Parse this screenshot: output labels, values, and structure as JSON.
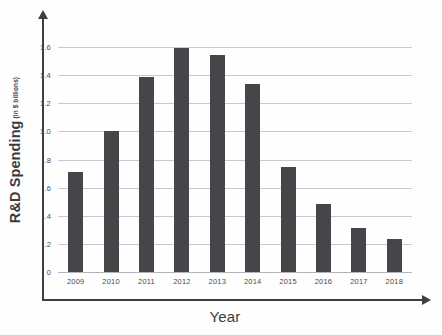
{
  "chart_data": {
    "type": "bar",
    "title": "",
    "xlabel": "Year",
    "ylabel": "R&D Spending",
    "ylabel_units": "(in $ billions)",
    "categories": [
      "2009",
      "2010",
      "2011",
      "2012",
      "2013",
      "2014",
      "2015",
      "2016",
      "2017",
      "2018"
    ],
    "values": [
      0.71,
      1.0,
      1.39,
      1.59,
      1.54,
      1.34,
      0.745,
      0.485,
      0.31,
      0.235
    ],
    "ylim": [
      0,
      1.6
    ],
    "ytick_values": [
      0,
      0.2,
      0.4,
      0.6,
      0.8,
      1.0,
      1.2,
      1.4,
      1.6
    ],
    "ytick_labels": [
      "0",
      ".2",
      ".4",
      ".6",
      ".8",
      "1.0",
      "1.2",
      "1.4",
      "1.6"
    ],
    "grid": true,
    "legend": false,
    "series": [
      {
        "name": "R&D Spending",
        "values": [
          0.71,
          1.0,
          1.39,
          1.59,
          1.54,
          1.34,
          0.745,
          0.485,
          0.31,
          0.235
        ]
      }
    ],
    "colors": {
      "bar": "#45454a",
      "gridline": "#c9c9cc",
      "axis": "#3f3f42",
      "background": "#fefefe",
      "tick_text": "#4a4a4d"
    }
  }
}
